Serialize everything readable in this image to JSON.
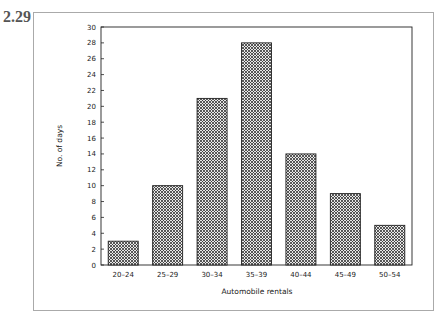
{
  "figure": {
    "number": "2.29"
  },
  "chart_data": {
    "type": "bar",
    "title": "",
    "xlabel": "Automobile rentals",
    "ylabel": "No. of days",
    "categories": [
      "20-24",
      "25-29",
      "30-34",
      "35-39",
      "40-44",
      "45-49",
      "50-54"
    ],
    "values": [
      3,
      10,
      21,
      28,
      14,
      9,
      5
    ],
    "ylim": [
      0,
      30
    ],
    "yticks": [
      0,
      2,
      4,
      6,
      8,
      10,
      12,
      14,
      16,
      18,
      20,
      22,
      24,
      26,
      28,
      30
    ],
    "grid": false,
    "legend": null,
    "bar_fill": "crosshatch",
    "colors": {
      "bar_stroke": "#222222",
      "hatch": "#333333",
      "axis": "#222222"
    }
  }
}
